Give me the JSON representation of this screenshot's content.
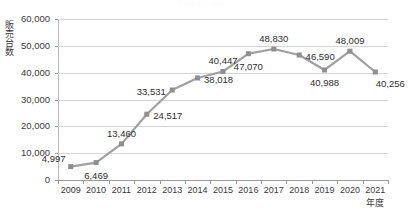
{
  "title_fragment": "販売台数の推移",
  "chart_data": {
    "type": "line",
    "title": "",
    "xlabel": "年度",
    "ylabel": "販売台数",
    "categories": [
      "2009",
      "2010",
      "2011",
      "2012",
      "2013",
      "2014",
      "2015",
      "2016",
      "2017",
      "2018",
      "2019",
      "2020",
      "2021"
    ],
    "values": [
      4997,
      6469,
      13460,
      24517,
      33531,
      38018,
      40447,
      47070,
      48830,
      46590,
      40988,
      48009,
      40256
    ],
    "value_labels": [
      "4,997",
      "6,469",
      "13,460",
      "24,517",
      "33,531",
      "38,018",
      "40,447",
      "47,070",
      "48,830",
      "46,590",
      "40,988",
      "48,009",
      "40,256"
    ],
    "label_positions": [
      "above-left",
      "below",
      "above",
      "right",
      "left",
      "right",
      "above",
      "below",
      "above",
      "right",
      "below",
      "above",
      "below-right"
    ],
    "ylim": [
      0,
      60000
    ],
    "ytick_values": [
      0,
      10000,
      20000,
      30000,
      40000,
      50000,
      60000
    ],
    "ytick_labels": [
      "0",
      "10,000",
      "20,000",
      "30,000",
      "40,000",
      "50,000",
      "60,000"
    ],
    "grid": true,
    "legend": "none",
    "series_color": "#a0a0a0",
    "marker": "square",
    "marker_color": "#8f8f8f"
  }
}
